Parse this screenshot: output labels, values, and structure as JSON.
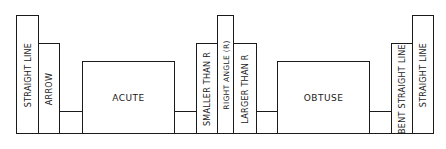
{
  "diagram": {
    "bars": [
      {
        "label": "STRAIGHT LINE",
        "orientation": "vertical"
      },
      {
        "label": "ARROW",
        "orientation": "vertical"
      },
      {
        "label": "",
        "orientation": "connector"
      },
      {
        "label": "ACUTE",
        "orientation": "horizontal"
      },
      {
        "label": "",
        "orientation": "connector"
      },
      {
        "label": "SMALLER THAN R",
        "orientation": "vertical"
      },
      {
        "label": "RIGHT ANGLE (R)",
        "orientation": "vertical"
      },
      {
        "label": "LARGER THAN R",
        "orientation": "vertical"
      },
      {
        "label": "",
        "orientation": "connector"
      },
      {
        "label": "OBTUSE",
        "orientation": "horizontal"
      },
      {
        "label": "",
        "orientation": "connector"
      },
      {
        "label": "BENT STRAIGHT LINE",
        "orientation": "vertical"
      },
      {
        "label": "STRAIGHT LINE",
        "orientation": "vertical"
      }
    ],
    "line_color": "#1a1a1a",
    "background": "#ffffff"
  }
}
